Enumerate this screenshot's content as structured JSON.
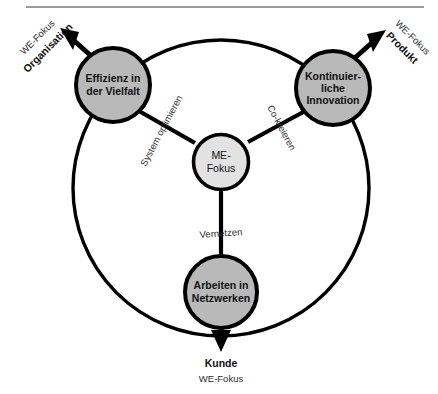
{
  "figure": {
    "top_rule_color": "#9a9a9a",
    "background": "#ffffff",
    "outline_color": "#000000",
    "node_fill": "#b9b9b9",
    "hub_fill": "#e2e2e2"
  },
  "hub": {
    "line1": "ME-",
    "line2": "Fokus"
  },
  "nodes": [
    {
      "id": "effizienz",
      "line1": "Effizienz in",
      "line2": "der Vielfalt",
      "line3": ""
    },
    {
      "id": "innovation",
      "line1": "Kontinuier-",
      "line2": "liche",
      "line3": "Innovation"
    },
    {
      "id": "netzwerke",
      "line1": "Arbeiten in",
      "line2": "Netzwerken",
      "line3": ""
    }
  ],
  "spokes": [
    {
      "id": "system-optimieren",
      "label": "System optimieren"
    },
    {
      "id": "co-kreieren",
      "label": "Co-kreieren"
    },
    {
      "id": "vernetzen",
      "label": "Vernetzen"
    }
  ],
  "outcomes": [
    {
      "id": "organisation",
      "sub": "WE-Fokus",
      "main": "Organisation"
    },
    {
      "id": "produkt",
      "sub": "WE-Fokus",
      "main": "Produkt"
    },
    {
      "id": "kunde",
      "main": "Kunde",
      "sub": "WE-Fokus"
    }
  ]
}
